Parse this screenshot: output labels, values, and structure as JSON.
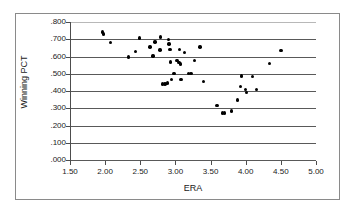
{
  "chart_data": {
    "type": "scatter",
    "title": "",
    "xlabel": "ERA",
    "ylabel": "Winning PCT",
    "xlim": [
      1.5,
      5.0
    ],
    "ylim": [
      0.0,
      0.8
    ],
    "xticks": [
      "1.50",
      "2.00",
      "2.50",
      "3.00",
      "3.50",
      "4.00",
      "4.50",
      "5.00"
    ],
    "xtick_values": [
      1.5,
      2.0,
      2.5,
      3.0,
      3.5,
      4.0,
      4.5,
      5.0
    ],
    "yticks": [
      ".000",
      ".100",
      ".200",
      ".300",
      ".400",
      ".500",
      ".600",
      ".700",
      ".800"
    ],
    "ytick_values": [
      0.0,
      0.1,
      0.2,
      0.3,
      0.4,
      0.5,
      0.6,
      0.7,
      0.8
    ],
    "grid": "horizontal",
    "legend": "none",
    "marker_color": "#000000",
    "points": [
      {
        "x": 1.96,
        "y": 0.742
      },
      {
        "x": 1.98,
        "y": 0.73
      },
      {
        "x": 2.08,
        "y": 0.68
      },
      {
        "x": 2.33,
        "y": 0.597
      },
      {
        "x": 2.43,
        "y": 0.63
      },
      {
        "x": 2.49,
        "y": 0.707
      },
      {
        "x": 2.64,
        "y": 0.655
      },
      {
        "x": 2.68,
        "y": 0.602
      },
      {
        "x": 2.71,
        "y": 0.683
      },
      {
        "x": 2.79,
        "y": 0.712
      },
      {
        "x": 2.78,
        "y": 0.637
      },
      {
        "x": 2.82,
        "y": 0.44
      },
      {
        "x": 2.85,
        "y": 0.441
      },
      {
        "x": 2.89,
        "y": 0.447
      },
      {
        "x": 2.9,
        "y": 0.7
      },
      {
        "x": 2.91,
        "y": 0.672
      },
      {
        "x": 2.92,
        "y": 0.64
      },
      {
        "x": 2.93,
        "y": 0.568
      },
      {
        "x": 2.94,
        "y": 0.466
      },
      {
        "x": 2.98,
        "y": 0.503
      },
      {
        "x": 3.02,
        "y": 0.578
      },
      {
        "x": 3.05,
        "y": 0.566
      },
      {
        "x": 3.06,
        "y": 0.641
      },
      {
        "x": 3.07,
        "y": 0.556
      },
      {
        "x": 3.08,
        "y": 0.466
      },
      {
        "x": 3.13,
        "y": 0.624
      },
      {
        "x": 3.19,
        "y": 0.503
      },
      {
        "x": 3.22,
        "y": 0.503
      },
      {
        "x": 3.27,
        "y": 0.578
      },
      {
        "x": 3.35,
        "y": 0.655
      },
      {
        "x": 3.4,
        "y": 0.455
      },
      {
        "x": 3.59,
        "y": 0.317
      },
      {
        "x": 3.67,
        "y": 0.272
      },
      {
        "x": 3.7,
        "y": 0.272
      },
      {
        "x": 3.8,
        "y": 0.284
      },
      {
        "x": 3.88,
        "y": 0.348
      },
      {
        "x": 3.93,
        "y": 0.426
      },
      {
        "x": 3.94,
        "y": 0.488
      },
      {
        "x": 4.0,
        "y": 0.41
      },
      {
        "x": 4.01,
        "y": 0.392
      },
      {
        "x": 4.1,
        "y": 0.484
      },
      {
        "x": 4.15,
        "y": 0.41
      },
      {
        "x": 4.34,
        "y": 0.56
      },
      {
        "x": 4.5,
        "y": 0.634
      }
    ]
  }
}
